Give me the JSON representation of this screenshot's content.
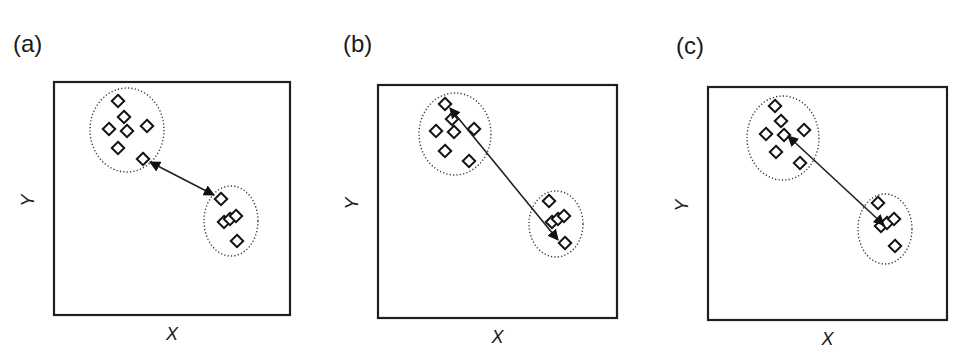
{
  "figure": {
    "panels": [
      {
        "label": "(a)",
        "xlabel": "X",
        "ylabel": "Y",
        "linkage": "single (nearest points)",
        "frame": {
          "x": 54,
          "y": 82,
          "w": 236,
          "h": 233
        },
        "label_pos": {
          "x": 13,
          "y": 52
        },
        "clusters": [
          {
            "cx": 127,
            "cy": 130,
            "rx": 37,
            "ry": 42,
            "points": [
              [
                118,
                101
              ],
              [
                124,
                117
              ],
              [
                109,
                129
              ],
              [
                127,
                131
              ],
              [
                147,
                126
              ],
              [
                118,
                148
              ],
              [
                143,
                159
              ]
            ]
          },
          {
            "cx": 231,
            "cy": 221,
            "rx": 27,
            "ry": 35,
            "points": [
              [
                221,
                199
              ],
              [
                224,
                222
              ],
              [
                230,
                219
              ],
              [
                236,
                216
              ],
              [
                237,
                241
              ]
            ]
          }
        ],
        "arrow": {
          "x1": 150,
          "y1": 162,
          "x2": 214,
          "y2": 195,
          "double": true
        }
      },
      {
        "label": "(b)",
        "xlabel": "X",
        "ylabel": "Y",
        "linkage": "complete (farthest points)",
        "frame": {
          "x": 378,
          "y": 85,
          "w": 239,
          "h": 233
        },
        "label_pos": {
          "x": 343,
          "y": 52
        },
        "clusters": [
          {
            "cx": 455,
            "cy": 134,
            "rx": 36,
            "ry": 41,
            "points": [
              [
                445,
                104
              ],
              [
                452,
                119
              ],
              [
                436,
                131
              ],
              [
                454,
                132
              ],
              [
                474,
                129
              ],
              [
                445,
                151
              ],
              [
                469,
                161
              ]
            ]
          },
          {
            "cx": 556,
            "cy": 224,
            "rx": 27,
            "ry": 33,
            "points": [
              [
                549,
                201
              ],
              [
                552,
                222
              ],
              [
                558,
                219
              ],
              [
                564,
                216
              ],
              [
                565,
                243
              ]
            ]
          }
        ],
        "arrow": {
          "x1": 450,
          "y1": 108,
          "x2": 558,
          "y2": 240,
          "double": true
        }
      },
      {
        "label": "(c)",
        "xlabel": "X",
        "ylabel": "Y",
        "linkage": "centroid / average",
        "frame": {
          "x": 708,
          "y": 87,
          "w": 239,
          "h": 233
        },
        "label_pos": {
          "x": 676,
          "y": 54
        },
        "clusters": [
          {
            "cx": 783,
            "cy": 138,
            "rx": 36,
            "ry": 42,
            "points": [
              [
                775,
                106
              ],
              [
                781,
                121
              ],
              [
                766,
                134
              ],
              [
                784,
                135
              ],
              [
                804,
                130
              ],
              [
                776,
                152
              ],
              [
                800,
                163
              ]
            ]
          },
          {
            "cx": 885,
            "cy": 229,
            "rx": 27,
            "ry": 35,
            "points": [
              [
                878,
                203
              ],
              [
                881,
                226
              ],
              [
                887,
                223
              ],
              [
                894,
                219
              ],
              [
                895,
                246
              ]
            ]
          }
        ],
        "arrow": {
          "x1": 788,
          "y1": 136,
          "x2": 884,
          "y2": 225,
          "double": true
        }
      }
    ]
  },
  "colors": {
    "ink": "#1f1f1f",
    "background": "#ffffff"
  }
}
